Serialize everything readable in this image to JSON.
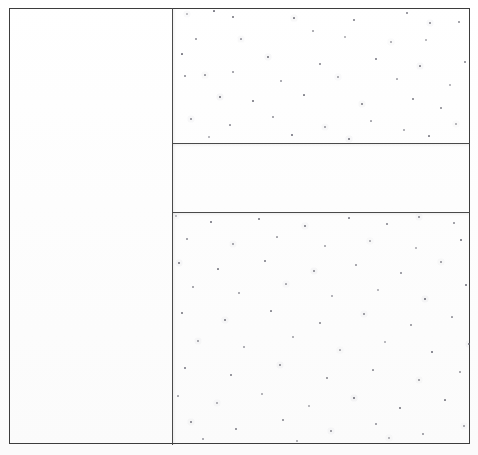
{
  "document": {
    "kind": "scanned-form-page",
    "caption": "",
    "background_color": "#ffffff",
    "rule_color": "#4a4a4a",
    "speckle_color": "#6e6e78"
  },
  "frame": {
    "name": "outer-frame",
    "x": 9,
    "y": 8,
    "width": 461,
    "height": 436
  },
  "rules": [
    {
      "name": "column-divider",
      "orientation": "vertical",
      "x": 172,
      "y": 8,
      "length": 437
    },
    {
      "name": "right-rule-top",
      "orientation": "horizontal",
      "x": 172,
      "y": 143,
      "length": 298
    },
    {
      "name": "right-rule-bottom",
      "orientation": "horizontal",
      "x": 172,
      "y": 212,
      "length": 298
    }
  ],
  "cells": [
    {
      "name": "cell-left",
      "label": "",
      "content": "blank",
      "x": 10,
      "y": 9,
      "width": 162,
      "height": 435
    },
    {
      "name": "cell-right-top",
      "label": "",
      "content": "speckled",
      "x": 173,
      "y": 9,
      "width": 297,
      "height": 134
    },
    {
      "name": "cell-right-middle",
      "label": "",
      "content": "blank",
      "x": 173,
      "y": 144,
      "width": 297,
      "height": 68
    },
    {
      "name": "cell-right-bottom",
      "label": "",
      "content": "speckled",
      "x": 173,
      "y": 213,
      "width": 297,
      "height": 231
    }
  ],
  "speckles": {
    "cell-right-top": [
      {
        "x": 14,
        "y": 5,
        "r": 1.1
      },
      {
        "x": 41,
        "y": 2,
        "r": 1.0
      },
      {
        "x": 60,
        "y": 8,
        "r": 0.8
      },
      {
        "x": 121,
        "y": 9,
        "r": 1.0
      },
      {
        "x": 181,
        "y": 11,
        "r": 0.9
      },
      {
        "x": 234,
        "y": 4,
        "r": 0.9
      },
      {
        "x": 257,
        "y": 14,
        "r": 0.8
      },
      {
        "x": 286,
        "y": 13,
        "r": 0.9
      },
      {
        "x": 23,
        "y": 30,
        "r": 0.9
      },
      {
        "x": 68,
        "y": 30,
        "r": 1.0
      },
      {
        "x": 140,
        "y": 22,
        "r": 0.8
      },
      {
        "x": 172,
        "y": 28,
        "r": 1.2
      },
      {
        "x": 218,
        "y": 33,
        "r": 0.8
      },
      {
        "x": 253,
        "y": 31,
        "r": 0.9
      },
      {
        "x": 9,
        "y": 45,
        "r": 1.0
      },
      {
        "x": 95,
        "y": 48,
        "r": 0.9
      },
      {
        "x": 147,
        "y": 55,
        "r": 1.1
      },
      {
        "x": 203,
        "y": 50,
        "r": 0.8
      },
      {
        "x": 247,
        "y": 57,
        "r": 1.0
      },
      {
        "x": 292,
        "y": 53,
        "r": 0.8
      },
      {
        "x": 12,
        "y": 67,
        "r": 0.9
      },
      {
        "x": 32,
        "y": 66,
        "r": 1.0
      },
      {
        "x": 60,
        "y": 63,
        "r": 0.8
      },
      {
        "x": 108,
        "y": 72,
        "r": 0.9
      },
      {
        "x": 165,
        "y": 68,
        "r": 0.8
      },
      {
        "x": 224,
        "y": 70,
        "r": 1.0
      },
      {
        "x": 277,
        "y": 76,
        "r": 0.9
      },
      {
        "x": 47,
        "y": 88,
        "r": 0.9
      },
      {
        "x": 80,
        "y": 92,
        "r": 0.8
      },
      {
        "x": 131,
        "y": 86,
        "r": 1.0
      },
      {
        "x": 189,
        "y": 95,
        "r": 0.9
      },
      {
        "x": 240,
        "y": 90,
        "r": 0.8
      },
      {
        "x": 268,
        "y": 99,
        "r": 0.9
      },
      {
        "x": 18,
        "y": 110,
        "r": 0.8
      },
      {
        "x": 57,
        "y": 116,
        "r": 1.0
      },
      {
        "x": 100,
        "y": 108,
        "r": 0.9
      },
      {
        "x": 152,
        "y": 118,
        "r": 0.8
      },
      {
        "x": 198,
        "y": 112,
        "r": 1.0
      },
      {
        "x": 231,
        "y": 121,
        "r": 0.9
      },
      {
        "x": 283,
        "y": 115,
        "r": 0.9
      },
      {
        "x": 36,
        "y": 128,
        "r": 0.8
      },
      {
        "x": 119,
        "y": 126,
        "r": 0.9
      },
      {
        "x": 176,
        "y": 130,
        "r": 0.8
      },
      {
        "x": 256,
        "y": 127,
        "r": 1.0
      }
    ],
    "cell-right-bottom": [
      {
        "x": 3,
        "y": 3,
        "r": 1.2
      },
      {
        "x": 38,
        "y": 9,
        "r": 0.9
      },
      {
        "x": 86,
        "y": 6,
        "r": 0.8
      },
      {
        "x": 132,
        "y": 13,
        "r": 0.9
      },
      {
        "x": 176,
        "y": 5,
        "r": 1.0
      },
      {
        "x": 214,
        "y": 11,
        "r": 0.9
      },
      {
        "x": 246,
        "y": 4,
        "r": 0.8
      },
      {
        "x": 281,
        "y": 10,
        "r": 0.9
      },
      {
        "x": 14,
        "y": 26,
        "r": 0.9
      },
      {
        "x": 60,
        "y": 31,
        "r": 0.8
      },
      {
        "x": 104,
        "y": 24,
        "r": 1.0
      },
      {
        "x": 152,
        "y": 33,
        "r": 0.9
      },
      {
        "x": 197,
        "y": 28,
        "r": 0.8
      },
      {
        "x": 243,
        "y": 35,
        "r": 0.9
      },
      {
        "x": 288,
        "y": 27,
        "r": 0.8
      },
      {
        "x": 6,
        "y": 50,
        "r": 0.9
      },
      {
        "x": 45,
        "y": 56,
        "r": 1.0
      },
      {
        "x": 92,
        "y": 48,
        "r": 0.8
      },
      {
        "x": 141,
        "y": 58,
        "r": 0.9
      },
      {
        "x": 183,
        "y": 52,
        "r": 1.1
      },
      {
        "x": 228,
        "y": 60,
        "r": 0.8
      },
      {
        "x": 268,
        "y": 49,
        "r": 0.9
      },
      {
        "x": 20,
        "y": 74,
        "r": 0.8
      },
      {
        "x": 66,
        "y": 80,
        "r": 0.9
      },
      {
        "x": 113,
        "y": 71,
        "r": 1.0
      },
      {
        "x": 159,
        "y": 83,
        "r": 0.8
      },
      {
        "x": 205,
        "y": 77,
        "r": 0.9
      },
      {
        "x": 252,
        "y": 86,
        "r": 0.9
      },
      {
        "x": 293,
        "y": 72,
        "r": 0.8
      },
      {
        "x": 9,
        "y": 100,
        "r": 0.9
      },
      {
        "x": 52,
        "y": 107,
        "r": 0.8
      },
      {
        "x": 98,
        "y": 98,
        "r": 1.0
      },
      {
        "x": 147,
        "y": 110,
        "r": 0.9
      },
      {
        "x": 191,
        "y": 101,
        "r": 0.8
      },
      {
        "x": 238,
        "y": 112,
        "r": 0.9
      },
      {
        "x": 279,
        "y": 104,
        "r": 1.0
      },
      {
        "x": 25,
        "y": 128,
        "r": 0.8
      },
      {
        "x": 71,
        "y": 134,
        "r": 0.9
      },
      {
        "x": 120,
        "y": 124,
        "r": 0.8
      },
      {
        "x": 167,
        "y": 137,
        "r": 1.0
      },
      {
        "x": 212,
        "y": 129,
        "r": 0.9
      },
      {
        "x": 259,
        "y": 139,
        "r": 0.8
      },
      {
        "x": 296,
        "y": 131,
        "r": 0.9
      },
      {
        "x": 12,
        "y": 155,
        "r": 0.9
      },
      {
        "x": 58,
        "y": 162,
        "r": 0.8
      },
      {
        "x": 107,
        "y": 152,
        "r": 0.9
      },
      {
        "x": 154,
        "y": 165,
        "r": 0.8
      },
      {
        "x": 200,
        "y": 157,
        "r": 1.0
      },
      {
        "x": 246,
        "y": 167,
        "r": 0.9
      },
      {
        "x": 287,
        "y": 159,
        "r": 0.8
      },
      {
        "x": 5,
        "y": 183,
        "r": 1.0
      },
      {
        "x": 44,
        "y": 190,
        "r": 0.9
      },
      {
        "x": 89,
        "y": 181,
        "r": 0.8
      },
      {
        "x": 136,
        "y": 193,
        "r": 0.9
      },
      {
        "x": 181,
        "y": 185,
        "r": 0.8
      },
      {
        "x": 227,
        "y": 195,
        "r": 0.9
      },
      {
        "x": 272,
        "y": 187,
        "r": 1.0
      },
      {
        "x": 18,
        "y": 209,
        "r": 0.9
      },
      {
        "x": 63,
        "y": 216,
        "r": 0.8
      },
      {
        "x": 110,
        "y": 207,
        "r": 0.9
      },
      {
        "x": 158,
        "y": 218,
        "r": 0.8
      },
      {
        "x": 203,
        "y": 211,
        "r": 0.9
      },
      {
        "x": 250,
        "y": 221,
        "r": 0.8
      },
      {
        "x": 291,
        "y": 213,
        "r": 0.9
      },
      {
        "x": 30,
        "y": 226,
        "r": 0.8
      },
      {
        "x": 124,
        "y": 228,
        "r": 0.9
      },
      {
        "x": 216,
        "y": 225,
        "r": 0.8
      }
    ]
  }
}
